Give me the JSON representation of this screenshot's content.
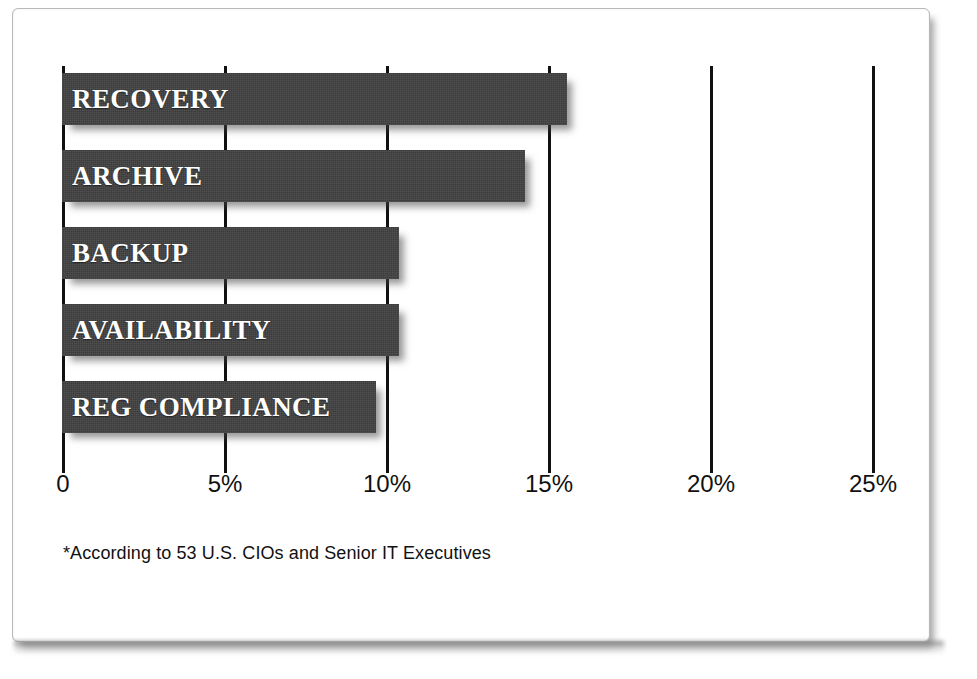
{
  "figure": {
    "footnote": "*According to 53 U.S. CIOs and Senior IT Executives",
    "bar_color": "#3b3b3b",
    "label_color": "#ffffff",
    "axis_color": "#111111",
    "frame_color": "#b9b9b9"
  },
  "chart_data": {
    "type": "bar",
    "orientation": "horizontal",
    "title": "",
    "subtitle": "",
    "xlabel": "",
    "ylabel": "",
    "categories": [
      "RECOVERY",
      "ARCHIVE",
      "BACKUP",
      "AVAILABILITY",
      "REG COMPLIANCE"
    ],
    "values": [
      15.6,
      14.3,
      10.4,
      10.4,
      9.7
    ],
    "value_unit": "%",
    "xlim": [
      0,
      26
    ],
    "xticks": [
      0,
      5,
      10,
      15,
      20,
      25
    ],
    "xtick_labels": [
      "0",
      "5%",
      "10%",
      "15%",
      "20%",
      "25%"
    ],
    "grid": true,
    "grid_axis": "x",
    "legend": false,
    "annotations": [
      "*According to 53 U.S. CIOs and Senior IT Executives"
    ],
    "bars": [
      {
        "label": "RECOVERY",
        "value": 15.6
      },
      {
        "label": "ARCHIVE",
        "value": 14.3
      },
      {
        "label": "BACKUP",
        "value": 10.4
      },
      {
        "label": "AVAILABILITY",
        "value": 10.4
      },
      {
        "label": "REG COMPLIANCE",
        "value": 9.7
      }
    ]
  }
}
